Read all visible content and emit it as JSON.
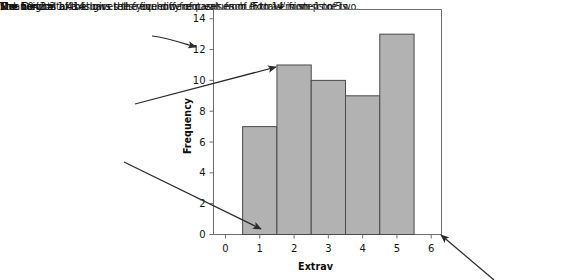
{
  "annotations": {
    "vertical_axis": "The vertical axis shows the frequency of cases from 0 to 14 in steps of two.",
    "bar_heights": "The heights of the bars tells you how frequent each extraversion score is.",
    "horizontal_axis": "The horizontal axis gives the five different values of 'Extrav' from 1 to 5."
  },
  "statistics": {
    "mean": "Mean = 3.2",
    "std_dev": "Std. Dev. = 1.414",
    "n": "N = 50"
  },
  "colors": {
    "bar_fill": "#b2b2b2",
    "bar_stroke": "#4a4a4a",
    "axis": "#6e6e6e",
    "text": "#141414",
    "arrow": "#2b2b2b"
  },
  "chart_data": {
    "type": "bar",
    "title": "",
    "xlabel": "Extrav",
    "ylabel": "Frequency",
    "categories": [
      1,
      2,
      3,
      4,
      5
    ],
    "values": [
      7,
      11,
      10,
      9,
      13
    ],
    "x_ticks": [
      0,
      1,
      2,
      3,
      4,
      5,
      6
    ],
    "y_ticks": [
      0,
      2,
      4,
      6,
      8,
      10,
      12,
      14
    ],
    "xlim": [
      -0.35,
      6.3
    ],
    "ylim": [
      0,
      14.6
    ],
    "bar_width": 1,
    "grid": false,
    "legend": null
  }
}
